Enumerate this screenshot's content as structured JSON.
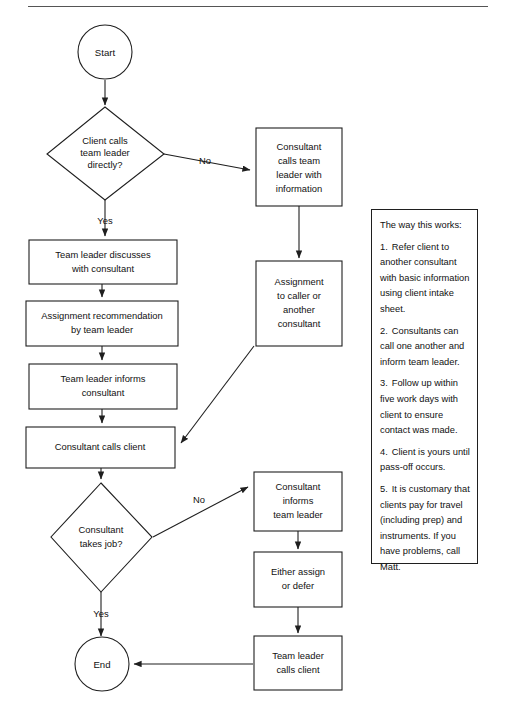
{
  "page": {
    "divider": "horizontal-rule"
  },
  "nodes": {
    "start": "Start",
    "decision_client_calls": "Client calls\nteam leader\ndirectly?",
    "consultant_calls_tl": "Consultant\ncalls team\nleader with\ninformation",
    "assignment_to_caller": "Assignment\nto caller or\nanother\nconsultant",
    "team_leader_discusses": "Team leader discusses\nwith consultant",
    "assignment_recommendation": "Assignment recommendation\nby team leader",
    "team_leader_informs": "Team leader informs\nconsultant",
    "consultant_calls_client": "Consultant calls client",
    "decision_takes_job": "Consultant\ntakes job?",
    "consultant_informs_tl": "Consultant\ninforms\nteam leader",
    "either_assign_or_defer": "Either assign\nor defer",
    "team_leader_calls_client": "Team leader\ncalls client",
    "end": "End"
  },
  "node_lines": {
    "decision_client_calls": [
      "Client calls",
      "team leader",
      "directly?"
    ],
    "consultant_calls_tl": [
      "Consultant",
      "calls team",
      "leader with",
      "information"
    ],
    "assignment_to_caller": [
      "Assignment",
      "to caller or",
      "another",
      "consultant"
    ],
    "team_leader_discusses": [
      "Team leader discusses",
      "with consultant"
    ],
    "assignment_recommendation": [
      "Assignment recommendation",
      "by team leader"
    ],
    "team_leader_informs": [
      "Team leader informs",
      "consultant"
    ],
    "consultant_calls_client": [
      "Consultant calls client"
    ],
    "decision_takes_job": [
      "Consultant",
      "takes job?"
    ],
    "consultant_informs_tl": [
      "Consultant",
      "informs",
      "team leader"
    ],
    "either_assign_or_defer": [
      "Either assign",
      "or defer"
    ],
    "team_leader_calls_client": [
      "Team leader",
      "calls client"
    ]
  },
  "edge_labels": {
    "client_calls_no": "No",
    "client_calls_yes": "Yes",
    "takes_job_no": "No",
    "takes_job_yes": "Yes"
  },
  "notes": {
    "heading": "The way this works:",
    "items": [
      {
        "number": "1.",
        "text": "Refer client to another consultant with basic information using client intake sheet."
      },
      {
        "number": "2.",
        "text": "Consultants can call one another and inform team leader."
      },
      {
        "number": "3.",
        "text": "Follow up within five work days with client to ensure contact was made."
      },
      {
        "number": "4.",
        "text": "Client is yours until pass-off occurs."
      },
      {
        "number": "5.",
        "text": "It is customary that clients pay for travel (including prep) and instruments. If you have problems, call Matt."
      }
    ]
  },
  "colors": {
    "stroke": "#1f1f1f",
    "fill": "#ffffff",
    "text": "#111111",
    "rule": "#555555"
  }
}
